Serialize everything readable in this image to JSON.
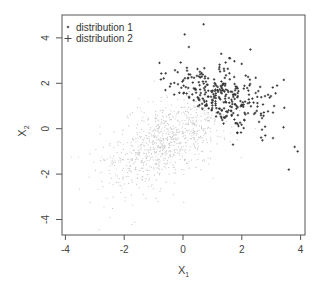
{
  "chart_data": {
    "type": "scatter",
    "title": "",
    "xlabel": "X",
    "xlabel_sub": "1",
    "ylabel": "X",
    "ylabel_sub": "2",
    "xlim": [
      -4.1,
      4.2
    ],
    "ylim": [
      -4.7,
      5.0
    ],
    "xticks": [
      -4,
      -2,
      0,
      2,
      4
    ],
    "yticks": [
      -4,
      -2,
      0,
      2,
      4
    ],
    "xtick_labels": [
      "-4",
      "-2",
      "0",
      "2",
      "4"
    ],
    "ytick_labels": [
      "-4",
      "-2",
      "0",
      "2",
      "4"
    ],
    "grid": false,
    "legend_position": "top-left",
    "series": [
      {
        "name": "distribution 1",
        "marker": "dot",
        "color": "#c8c8c8",
        "approx_center": [
          -0.5,
          -0.5
        ],
        "approx_sd": [
          1.1,
          1.1
        ],
        "approx_correlation": 0.6,
        "n_approx": 900
      },
      {
        "name": "distribution 2",
        "marker": "plus",
        "color": "#333333",
        "approx_center": [
          1.2,
          1.3
        ],
        "approx_sd": [
          0.9,
          0.8
        ],
        "approx_correlation": -0.3,
        "n_approx": 300,
        "notable_points": [
          [
            0.7,
            4.6
          ],
          [
            0.2,
            3.6
          ],
          [
            -0.8,
            2.9
          ],
          [
            1.3,
            3.3
          ],
          [
            1.6,
            3.1
          ],
          [
            3.2,
            1.9
          ],
          [
            3.8,
            -0.8
          ],
          [
            3.6,
            -1.8
          ],
          [
            3.9,
            -1.0
          ],
          [
            1.7,
            -0.7
          ],
          [
            2.8,
            -0.3
          ],
          [
            3.1,
            1.0
          ],
          [
            -0.3,
            1.5
          ],
          [
            -0.6,
            1.7
          ]
        ]
      }
    ]
  },
  "legend": {
    "items": [
      {
        "label": "distribution 1",
        "marker": "•"
      },
      {
        "label": "distribution 2",
        "marker": "+"
      }
    ]
  }
}
